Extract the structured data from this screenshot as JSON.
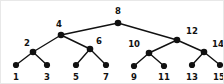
{
  "figure": {
    "width": 224,
    "height": 84,
    "background_color": "#ffffff",
    "node_color": "#111111",
    "edge_color": "#111111"
  },
  "chart_data": {
    "type": "diagram",
    "diagram_type": "binary-search-tree",
    "title": "",
    "xlabel": "",
    "ylabel": "",
    "grid": false,
    "legend": null,
    "levels": 4,
    "node_count": 15,
    "nodes": [
      {
        "id": "n8",
        "label": "8",
        "x": 117,
        "y": 22,
        "level": 0,
        "label_x": 117,
        "label_y": 13,
        "label_anchor": "middle"
      },
      {
        "id": "n4",
        "label": "4",
        "x": 60,
        "y": 34,
        "level": 1,
        "label_x": 58,
        "label_y": 26,
        "label_anchor": "middle"
      },
      {
        "id": "n12",
        "label": "12",
        "x": 176,
        "y": 39,
        "level": 1,
        "label_x": 185,
        "label_y": 33,
        "label_anchor": "start"
      },
      {
        "id": "n2",
        "label": "2",
        "x": 32,
        "y": 51,
        "level": 2,
        "label_x": 26,
        "label_y": 45,
        "label_anchor": "middle"
      },
      {
        "id": "n6",
        "label": "6",
        "x": 89,
        "y": 48,
        "level": 2,
        "label_x": 95,
        "label_y": 43,
        "label_anchor": "start"
      },
      {
        "id": "n10",
        "label": "10",
        "x": 148,
        "y": 52,
        "level": 2,
        "label_x": 139,
        "label_y": 46,
        "label_anchor": "end"
      },
      {
        "id": "n14",
        "label": "14",
        "x": 203,
        "y": 51,
        "level": 2,
        "label_x": 211,
        "label_y": 46,
        "label_anchor": "start"
      },
      {
        "id": "n1",
        "label": "1",
        "x": 15,
        "y": 64,
        "level": 3,
        "label_x": 15,
        "label_y": 79,
        "label_anchor": "middle"
      },
      {
        "id": "n3",
        "label": "3",
        "x": 46,
        "y": 64,
        "level": 3,
        "label_x": 46,
        "label_y": 79,
        "label_anchor": "middle"
      },
      {
        "id": "n5",
        "label": "5",
        "x": 75,
        "y": 64,
        "level": 3,
        "label_x": 75,
        "label_y": 79,
        "label_anchor": "middle"
      },
      {
        "id": "n7",
        "label": "7",
        "x": 105,
        "y": 64,
        "level": 3,
        "label_x": 105,
        "label_y": 79,
        "label_anchor": "middle"
      },
      {
        "id": "n9",
        "label": "9",
        "x": 133,
        "y": 65,
        "level": 3,
        "label_x": 133,
        "label_y": 79,
        "label_anchor": "middle"
      },
      {
        "id": "n11",
        "label": "11",
        "x": 163,
        "y": 65,
        "level": 3,
        "label_x": 163,
        "label_y": 79,
        "label_anchor": "middle"
      },
      {
        "id": "n13",
        "label": "13",
        "x": 191,
        "y": 64,
        "level": 3,
        "label_x": 191,
        "label_y": 79,
        "label_anchor": "middle"
      },
      {
        "id": "n15",
        "label": "15",
        "x": 219,
        "y": 64,
        "level": 3,
        "label_x": 218,
        "label_y": 79,
        "label_anchor": "middle"
      }
    ],
    "edges": [
      {
        "from": "n8",
        "to": "n4"
      },
      {
        "from": "n8",
        "to": "n12"
      },
      {
        "from": "n4",
        "to": "n2"
      },
      {
        "from": "n4",
        "to": "n6"
      },
      {
        "from": "n12",
        "to": "n10"
      },
      {
        "from": "n12",
        "to": "n14"
      },
      {
        "from": "n2",
        "to": "n1"
      },
      {
        "from": "n2",
        "to": "n3"
      },
      {
        "from": "n6",
        "to": "n5"
      },
      {
        "from": "n6",
        "to": "n7"
      },
      {
        "from": "n10",
        "to": "n9"
      },
      {
        "from": "n10",
        "to": "n11"
      },
      {
        "from": "n14",
        "to": "n13"
      },
      {
        "from": "n14",
        "to": "n15"
      }
    ]
  }
}
